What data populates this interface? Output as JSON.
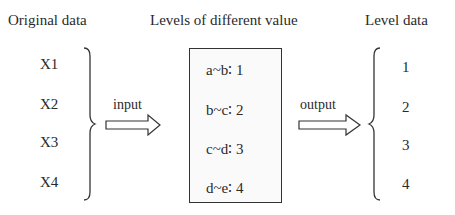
{
  "headers": {
    "original": "Original data",
    "levels": "Levels of different value",
    "level_data": "Level data"
  },
  "original_data": [
    "X1",
    "X2",
    "X3",
    "X4"
  ],
  "level_rules": [
    "a~b∶ 1",
    "b~c∶ 2",
    "c~d∶ 3",
    "d~e∶ 4"
  ],
  "level_values": [
    "1",
    "2",
    "3",
    "4"
  ],
  "arrows": {
    "input": "input",
    "output": "output"
  }
}
